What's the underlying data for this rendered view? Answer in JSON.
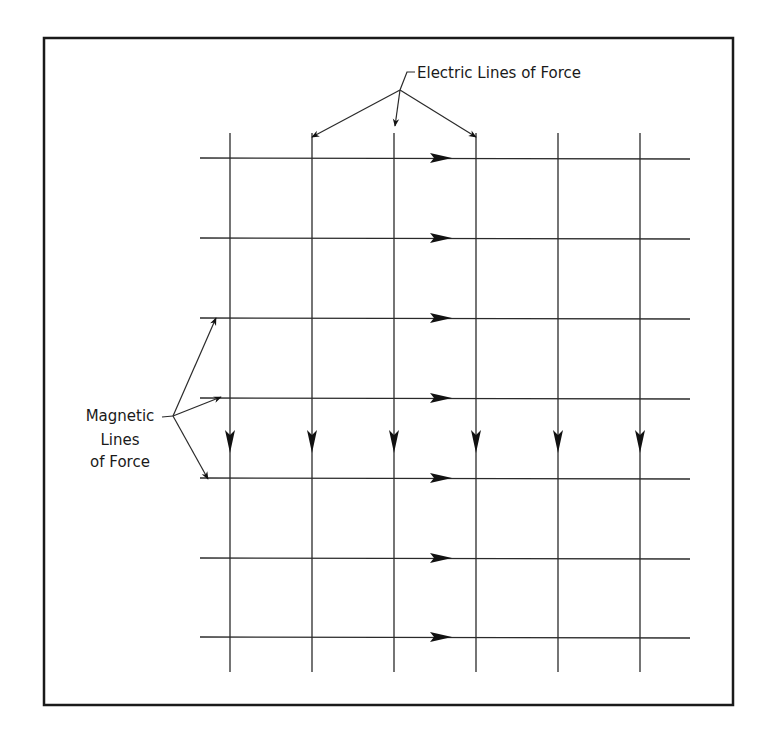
{
  "diagram": {
    "frame": {
      "x": 44,
      "y": 38,
      "width": 689,
      "height": 667,
      "stroke": "#1a1a1a",
      "stroke_width": 2.5
    },
    "line_color": "#2a2a2a",
    "arrow_color": "#111111",
    "electric_lines": {
      "direction": "down",
      "x_positions": [
        230,
        312,
        394,
        476,
        558,
        640
      ],
      "y_start": 133,
      "y_end": 672,
      "arrowhead_y": 441
    },
    "magnetic_lines": {
      "direction": "right",
      "y_positions": [
        158,
        238,
        318,
        398,
        478,
        558,
        637
      ],
      "x_start": 200,
      "x_end": 690,
      "arrowhead_x": 441
    },
    "labels": {
      "electric": {
        "text": "Electric Lines of Force",
        "x": 417,
        "y": 78,
        "leader_junction": [
          400,
          90
        ],
        "leader_start": [
          415,
          72
        ],
        "targets": [
          [
            312,
            137
          ],
          [
            395,
            126
          ],
          [
            476,
            137
          ]
        ]
      },
      "magnetic": {
        "lines": [
          "Magnetic",
          "Lines",
          "of Force"
        ],
        "x_center": 120,
        "y_positions": [
          421,
          445,
          467
        ],
        "leader_start": [
          162,
          417
        ],
        "leader_junction": [
          173,
          416
        ],
        "targets": [
          [
            216,
            318
          ],
          [
            221,
            397
          ],
          [
            208,
            479
          ]
        ]
      }
    }
  }
}
